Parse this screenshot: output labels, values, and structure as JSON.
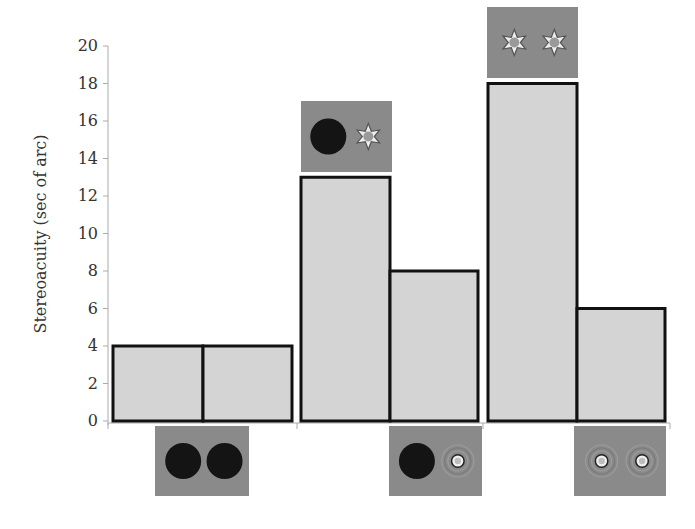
{
  "chart_data": {
    "type": "bar",
    "title": "",
    "xlabel": "",
    "ylabel": "Stereoacuity (sec of arc)",
    "ylim": [
      0,
      20
    ],
    "yticks": [
      0,
      2,
      4,
      6,
      8,
      10,
      12,
      14,
      16,
      18,
      20
    ],
    "grid": false,
    "legend": "none",
    "groups": [
      {
        "name": "group-1",
        "bars": [
          {
            "value": 4,
            "stimulus": "two dark disks (bottom image)"
          },
          {
            "value": 4,
            "stimulus": "two dark disks (bottom image)"
          }
        ],
        "top_image": null,
        "bottom_image": {
          "left": "dark-disk",
          "right": "dark-disk"
        }
      },
      {
        "name": "group-2",
        "bars": [
          {
            "value": 13,
            "stimulus": "dark disk + star pattern (top image)"
          },
          {
            "value": 8,
            "stimulus": "dark disk + ring target (bottom image)"
          }
        ],
        "top_image": {
          "left": "dark-disk",
          "right": "star-pattern"
        },
        "bottom_image": {
          "left": "dark-disk",
          "right": "ring-target"
        }
      },
      {
        "name": "group-3",
        "bars": [
          {
            "value": 18,
            "stimulus": "two star patterns (top image)"
          },
          {
            "value": 6,
            "stimulus": "two ring targets (bottom image)"
          }
        ],
        "top_image": {
          "left": "star-pattern",
          "right": "star-pattern"
        },
        "bottom_image": {
          "left": "ring-target",
          "right": "ring-target"
        }
      }
    ],
    "categories": [
      "G1-left",
      "G1-right",
      "G2-left",
      "G2-right",
      "G3-left",
      "G3-right"
    ],
    "values": [
      4,
      4,
      13,
      8,
      18,
      6
    ]
  },
  "colors": {
    "bar_fill": "#d4d4d4",
    "bar_stroke": "#111111",
    "axis": "#aaaaaa",
    "panel_bg": "#8a8a8a",
    "disk": "#141414"
  }
}
